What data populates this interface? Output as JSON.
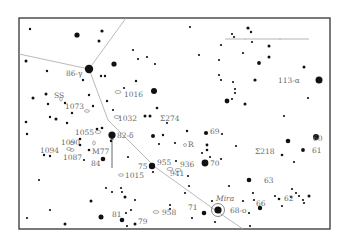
{
  "chart": {
    "frame": {
      "x": 19,
      "y": 18,
      "w": 311,
      "h": 211
    },
    "boundaries": [
      {
        "id": "boundary-west",
        "points": [
          [
            19,
            54
          ],
          [
            89,
            69
          ]
        ]
      },
      {
        "id": "boundary-north",
        "points": [
          [
            89,
            69
          ],
          [
            126,
            18
          ]
        ]
      },
      {
        "id": "boundary-south",
        "points": [
          [
            89,
            69
          ],
          [
            108,
            120
          ],
          [
            155,
            167
          ],
          [
            215,
            210
          ],
          [
            243,
            229
          ]
        ]
      }
    ],
    "scale_bar": {
      "x1": 225,
      "x2": 309,
      "y": 39,
      "ticks": [
        245,
        280
      ]
    },
    "arrow": {
      "x": 112,
      "y1": 168,
      "y2": 135
    },
    "stars": [
      {
        "x": 30,
        "y": 29,
        "r": 1.2
      },
      {
        "x": 77,
        "y": 35,
        "r": 2.6
      },
      {
        "x": 102,
        "y": 31,
        "r": 1.6
      },
      {
        "x": 99,
        "y": 41,
        "r": 1.5
      },
      {
        "x": 26,
        "y": 61,
        "r": 1.5
      },
      {
        "x": 89,
        "y": 69,
        "r": 4.2
      },
      {
        "x": 114,
        "y": 64,
        "r": 2.6
      },
      {
        "x": 47,
        "y": 71,
        "r": 1.2
      },
      {
        "x": 83,
        "y": 80,
        "r": 1.2
      },
      {
        "x": 101,
        "y": 76,
        "r": 1.2
      },
      {
        "x": 105,
        "y": 76,
        "r": 1.2
      },
      {
        "x": 133,
        "y": 50,
        "r": 1.1
      },
      {
        "x": 138,
        "y": 59,
        "r": 1.1
      },
      {
        "x": 147,
        "y": 57,
        "r": 1.1
      },
      {
        "x": 155,
        "y": 64,
        "r": 1.1
      },
      {
        "x": 136,
        "y": 81,
        "r": 1.2
      },
      {
        "x": 124,
        "y": 88,
        "r": 1.1
      },
      {
        "x": 154,
        "y": 91,
        "r": 3.0
      },
      {
        "x": 33,
        "y": 98,
        "r": 1.5
      },
      {
        "x": 46,
        "y": 94,
        "r": 1.5
      },
      {
        "x": 48,
        "y": 104,
        "r": 1.2
      },
      {
        "x": 65,
        "y": 103,
        "r": 1.2
      },
      {
        "x": 89,
        "y": 95,
        "r": 1.2
      },
      {
        "x": 93,
        "y": 106,
        "r": 1.2
      },
      {
        "x": 107,
        "y": 101,
        "r": 1.2
      },
      {
        "x": 113,
        "y": 110,
        "r": 1.1
      },
      {
        "x": 50,
        "y": 117,
        "r": 1.2
      },
      {
        "x": 56,
        "y": 119,
        "r": 1.5
      },
      {
        "x": 72,
        "y": 113,
        "r": 1.2
      },
      {
        "x": 67,
        "y": 123,
        "r": 1.2
      },
      {
        "x": 157,
        "y": 108,
        "r": 1.3
      },
      {
        "x": 145,
        "y": 116,
        "r": 1.5
      },
      {
        "x": 150,
        "y": 116,
        "r": 1.5
      },
      {
        "x": 167,
        "y": 123,
        "r": 1.1
      },
      {
        "x": 190,
        "y": 27,
        "r": 1.1
      },
      {
        "x": 248,
        "y": 28,
        "r": 1.6
      },
      {
        "x": 251,
        "y": 32,
        "r": 1.2
      },
      {
        "x": 232,
        "y": 34,
        "r": 1.1
      },
      {
        "x": 234,
        "y": 37,
        "r": 1.1
      },
      {
        "x": 252,
        "y": 42,
        "r": 1.1
      },
      {
        "x": 221,
        "y": 45,
        "r": 1.1
      },
      {
        "x": 269,
        "y": 46,
        "r": 1.5
      },
      {
        "x": 199,
        "y": 55,
        "r": 1.1
      },
      {
        "x": 243,
        "y": 53,
        "r": 1.1
      },
      {
        "x": 269,
        "y": 57,
        "r": 1.5
      },
      {
        "x": 219,
        "y": 60,
        "r": 1.1
      },
      {
        "x": 259,
        "y": 63,
        "r": 1.9
      },
      {
        "x": 304,
        "y": 67,
        "r": 1.5
      },
      {
        "x": 319,
        "y": 80,
        "r": 3.5
      },
      {
        "x": 219,
        "y": 75,
        "r": 1.1
      },
      {
        "x": 221,
        "y": 80,
        "r": 1.1
      },
      {
        "x": 233,
        "y": 82,
        "r": 1.1
      },
      {
        "x": 255,
        "y": 80,
        "r": 1.6
      },
      {
        "x": 235,
        "y": 89,
        "r": 1.1
      },
      {
        "x": 235,
        "y": 93,
        "r": 1.1
      },
      {
        "x": 232,
        "y": 99,
        "r": 1.1
      },
      {
        "x": 227,
        "y": 101,
        "r": 2.4
      },
      {
        "x": 245,
        "y": 104,
        "r": 1.5
      },
      {
        "x": 308,
        "y": 98,
        "r": 1.1
      },
      {
        "x": 284,
        "y": 116,
        "r": 1.1
      },
      {
        "x": 26,
        "y": 122,
        "r": 1.3
      },
      {
        "x": 27,
        "y": 134,
        "r": 1.2
      },
      {
        "x": 97,
        "y": 129,
        "r": 1.3
      },
      {
        "x": 102,
        "y": 128,
        "r": 1.3
      },
      {
        "x": 112,
        "y": 135,
        "r": 3.6
      },
      {
        "x": 111,
        "y": 141,
        "r": 1.2
      },
      {
        "x": 80,
        "y": 139,
        "r": 1.3
      },
      {
        "x": 80,
        "y": 145,
        "r": 1.3
      },
      {
        "x": 89,
        "y": 150,
        "r": 1.3
      },
      {
        "x": 44,
        "y": 155,
        "r": 1.2
      },
      {
        "x": 50,
        "y": 156,
        "r": 1.2
      },
      {
        "x": 103,
        "y": 159,
        "r": 2.3
      },
      {
        "x": 84,
        "y": 160,
        "r": 1.1
      },
      {
        "x": 128,
        "y": 157,
        "r": 1.1
      },
      {
        "x": 153,
        "y": 136,
        "r": 2.0
      },
      {
        "x": 163,
        "y": 135,
        "r": 1.2
      },
      {
        "x": 159,
        "y": 144,
        "r": 1.1
      },
      {
        "x": 175,
        "y": 143,
        "r": 1.1
      },
      {
        "x": 187,
        "y": 131,
        "r": 1.2
      },
      {
        "x": 206,
        "y": 133,
        "r": 2.1
      },
      {
        "x": 222,
        "y": 134,
        "r": 1.1
      },
      {
        "x": 207,
        "y": 145,
        "r": 1.4
      },
      {
        "x": 207,
        "y": 150,
        "r": 1.3
      },
      {
        "x": 202,
        "y": 153,
        "r": 1.1
      },
      {
        "x": 210,
        "y": 157,
        "r": 1.1
      },
      {
        "x": 236,
        "y": 146,
        "r": 1.1
      },
      {
        "x": 152,
        "y": 166,
        "r": 3.2
      },
      {
        "x": 153,
        "y": 172,
        "r": 1.1
      },
      {
        "x": 176,
        "y": 161,
        "r": 1.1
      },
      {
        "x": 205,
        "y": 163,
        "r": 3.4
      },
      {
        "x": 221,
        "y": 159,
        "r": 1.1
      },
      {
        "x": 188,
        "y": 176,
        "r": 1.1
      },
      {
        "x": 288,
        "y": 141,
        "r": 2.3
      },
      {
        "x": 316,
        "y": 137,
        "r": 3.0
      },
      {
        "x": 303,
        "y": 150,
        "r": 1.9
      },
      {
        "x": 282,
        "y": 155,
        "r": 1.3
      },
      {
        "x": 294,
        "y": 162,
        "r": 1.1
      },
      {
        "x": 39,
        "y": 180,
        "r": 1.1
      },
      {
        "x": 106,
        "y": 188,
        "r": 1.1
      },
      {
        "x": 121,
        "y": 188,
        "r": 1.1
      },
      {
        "x": 122,
        "y": 192,
        "r": 1.1
      },
      {
        "x": 112,
        "y": 192,
        "r": 1.1
      },
      {
        "x": 91,
        "y": 201,
        "r": 1.5
      },
      {
        "x": 125,
        "y": 197,
        "r": 1.5
      },
      {
        "x": 135,
        "y": 200,
        "r": 1.1
      },
      {
        "x": 50,
        "y": 210,
        "r": 1.1
      },
      {
        "x": 101,
        "y": 217,
        "r": 2.5
      },
      {
        "x": 122,
        "y": 220,
        "r": 2.3
      },
      {
        "x": 126,
        "y": 213,
        "r": 1.1
      },
      {
        "x": 131,
        "y": 210,
        "r": 1.1
      },
      {
        "x": 27,
        "y": 218,
        "r": 1.1
      },
      {
        "x": 135,
        "y": 224,
        "r": 1.5
      },
      {
        "x": 65,
        "y": 224,
        "r": 1.5
      },
      {
        "x": 127,
        "y": 226,
        "r": 1.1
      },
      {
        "x": 170,
        "y": 205,
        "r": 1.1
      },
      {
        "x": 170,
        "y": 209,
        "r": 1.1
      },
      {
        "x": 185,
        "y": 193,
        "r": 1.1
      },
      {
        "x": 189,
        "y": 186,
        "r": 1.1
      },
      {
        "x": 204,
        "y": 213,
        "r": 2.3
      },
      {
        "x": 192,
        "y": 218,
        "r": 1.1
      },
      {
        "x": 212,
        "y": 201,
        "r": 1.1
      },
      {
        "x": 229,
        "y": 186,
        "r": 1.1
      },
      {
        "x": 249,
        "y": 180,
        "r": 2.3
      },
      {
        "x": 253,
        "y": 193,
        "r": 1.1
      },
      {
        "x": 254,
        "y": 200,
        "r": 1.1
      },
      {
        "x": 243,
        "y": 201,
        "r": 1.1
      },
      {
        "x": 260,
        "y": 208,
        "r": 2.2
      },
      {
        "x": 249,
        "y": 213,
        "r": 1.1
      },
      {
        "x": 250,
        "y": 226,
        "r": 1.1
      },
      {
        "x": 275,
        "y": 196,
        "r": 1.1
      },
      {
        "x": 279,
        "y": 199,
        "r": 1.3
      },
      {
        "x": 292,
        "y": 189,
        "r": 1.1
      },
      {
        "x": 296,
        "y": 193,
        "r": 1.1
      },
      {
        "x": 291,
        "y": 197,
        "r": 1.1
      },
      {
        "x": 282,
        "y": 206,
        "r": 1.1
      },
      {
        "x": 299,
        "y": 196,
        "r": 1.1
      },
      {
        "x": 303,
        "y": 200,
        "r": 1.1
      },
      {
        "x": 309,
        "y": 196,
        "r": 1.5
      },
      {
        "x": 304,
        "y": 203,
        "r": 1.1
      },
      {
        "x": 215,
        "y": 222,
        "r": 1.1
      }
    ],
    "mira": {
      "x": 218,
      "y": 210,
      "r": 3.6,
      "ring": 6.5
    },
    "galaxies": [
      {
        "x": 118,
        "y": 92,
        "rx": 3,
        "ry": 1.5
      },
      {
        "x": 117,
        "y": 117,
        "rx": 3,
        "ry": 1.5
      },
      {
        "x": 87,
        "y": 111,
        "rx": 2.5,
        "ry": 1.3
      },
      {
        "x": 61,
        "y": 99,
        "rx": 1.3,
        "ry": 2
      },
      {
        "x": 98,
        "y": 132,
        "rx": 3,
        "ry": 1.5
      },
      {
        "x": 69,
        "y": 149,
        "rx": 2.5,
        "ry": 1.4
      },
      {
        "x": 72,
        "y": 143,
        "rx": 2,
        "ry": 1.5
      },
      {
        "x": 72,
        "y": 150,
        "rx": 2,
        "ry": 1.5
      },
      {
        "x": 94,
        "y": 143,
        "rx": 1.3,
        "ry": 2
      },
      {
        "x": 121,
        "y": 175,
        "rx": 2.5,
        "ry": 1.3
      },
      {
        "x": 170,
        "y": 169,
        "rx": 3,
        "ry": 1.5
      },
      {
        "x": 178,
        "y": 170,
        "rx": 3,
        "ry": 1.5
      },
      {
        "x": 156,
        "y": 212,
        "rx": 3,
        "ry": 1.4
      },
      {
        "x": 185,
        "y": 145,
        "rx": 1.5,
        "ry": 1.5
      }
    ],
    "labels": [
      {
        "text": "86-γ",
        "x": 66,
        "y": 76
      },
      {
        "text": "SS",
        "x": 54,
        "y": 98
      },
      {
        "text": "1073",
        "x": 65,
        "y": 109
      },
      {
        "text": "1016",
        "x": 124,
        "y": 97
      },
      {
        "text": "1032",
        "x": 118,
        "y": 121
      },
      {
        "text": "Σ274",
        "x": 160,
        "y": 121
      },
      {
        "text": "113-α",
        "x": 278,
        "y": 83
      },
      {
        "text": "1055",
        "x": 75,
        "y": 135
      },
      {
        "text": "82-δ",
        "x": 117,
        "y": 138
      },
      {
        "text": "1090",
        "x": 61,
        "y": 145
      },
      {
        "text": "1094",
        "x": 40,
        "y": 153
      },
      {
        "text": "M77",
        "x": 92,
        "y": 154
      },
      {
        "text": "1087",
        "x": 63,
        "y": 160
      },
      {
        "text": "84",
        "x": 91,
        "y": 166
      },
      {
        "text": "69",
        "x": 210,
        "y": 134
      },
      {
        "text": "R",
        "x": 188,
        "y": 147
      },
      {
        "text": "Σ218",
        "x": 255,
        "y": 154
      },
      {
        "text": "60",
        "x": 313,
        "y": 141
      },
      {
        "text": "61",
        "x": 312,
        "y": 153
      },
      {
        "text": "70",
        "x": 210,
        "y": 166
      },
      {
        "text": "75",
        "x": 138,
        "y": 169
      },
      {
        "text": "955",
        "x": 157,
        "y": 165
      },
      {
        "text": "936",
        "x": 180,
        "y": 167
      },
      {
        "text": "941",
        "x": 170,
        "y": 176
      },
      {
        "text": "1015",
        "x": 125,
        "y": 178
      },
      {
        "text": "63",
        "x": 264,
        "y": 183
      },
      {
        "text": "Mira",
        "x": 216,
        "y": 201,
        "italic": true
      },
      {
        "text": "68-o",
        "x": 230,
        "y": 213
      },
      {
        "text": "66",
        "x": 256,
        "y": 206
      },
      {
        "text": "62",
        "x": 284,
        "y": 201
      },
      {
        "text": "71",
        "x": 188,
        "y": 210
      },
      {
        "text": "958",
        "x": 162,
        "y": 215
      },
      {
        "text": "81",
        "x": 112,
        "y": 217
      },
      {
        "text": "79",
        "x": 138,
        "y": 224
      }
    ]
  }
}
